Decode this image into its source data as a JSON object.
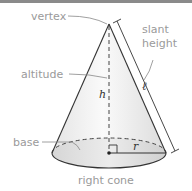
{
  "diagram": {
    "caption": "right cone",
    "labels": {
      "vertex": "vertex",
      "slant_height_line1": "slant",
      "slant_height_line2": "height",
      "altitude": "altitude",
      "base": "base"
    },
    "variables": {
      "height": "h",
      "slant": "ℓ",
      "radius": "r"
    },
    "colors": {
      "label_text": "#9a9a9a",
      "outline": "#333333",
      "border": "#8a8a8a"
    }
  }
}
